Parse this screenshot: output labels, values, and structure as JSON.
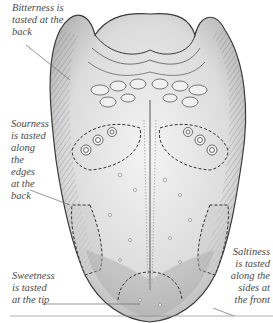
{
  "diagram": {
    "labels": {
      "bitterness": "Bitterness is\ntasted at the\nback",
      "sourness": "Sourness\nis tasted\nalong\nthe\nedges\nat the\nback",
      "saltiness": "Saltiness\nis tasted\nalong the\nsides at\nthe front",
      "sweetness": "Sweetness\nis tasted\nat the tip"
    },
    "colors": {
      "ink": "#3a3a3a",
      "text": "#4a4a4a",
      "shade_light": "#e6e6e6",
      "shade_mid": "#c9c9c9",
      "shade_dark": "#9a9a9a"
    }
  }
}
